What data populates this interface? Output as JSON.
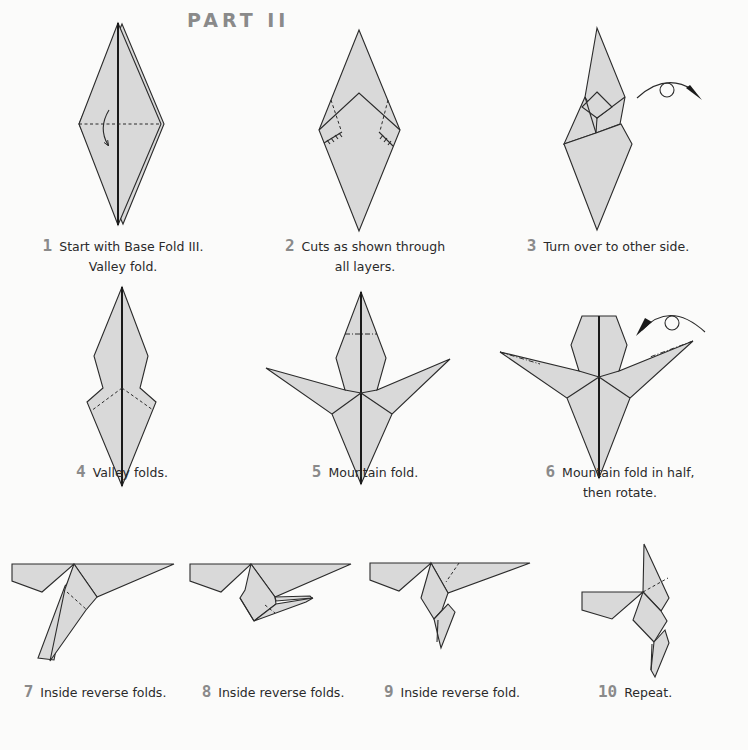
{
  "title": "PART II",
  "steps": [
    {
      "number": "1",
      "line1": "Start with Base Fold III.",
      "line2": "Valley fold."
    },
    {
      "number": "2",
      "line1": "Cuts as shown through",
      "line2": "all layers."
    },
    {
      "number": "3",
      "line1": "Turn over to other side.",
      "line2": ""
    },
    {
      "number": "4",
      "line1": "Valley folds.",
      "line2": ""
    },
    {
      "number": "5",
      "line1": "Mountain fold.",
      "line2": ""
    },
    {
      "number": "6",
      "line1": "Mountain fold in half,",
      "line2": "then rotate."
    },
    {
      "number": "7",
      "line1": "Inside reverse folds.",
      "line2": ""
    },
    {
      "number": "8",
      "line1": "Inside reverse folds.",
      "line2": ""
    },
    {
      "number": "9",
      "line1": "Inside reverse fold.",
      "line2": ""
    },
    {
      "number": "10",
      "line1": "Repeat.",
      "line2": ""
    }
  ],
  "colors": {
    "paper": "#d9d9d9",
    "line": "#2b2b2b",
    "numeral": "#8a8a8a",
    "background": "#fbfbfa"
  }
}
